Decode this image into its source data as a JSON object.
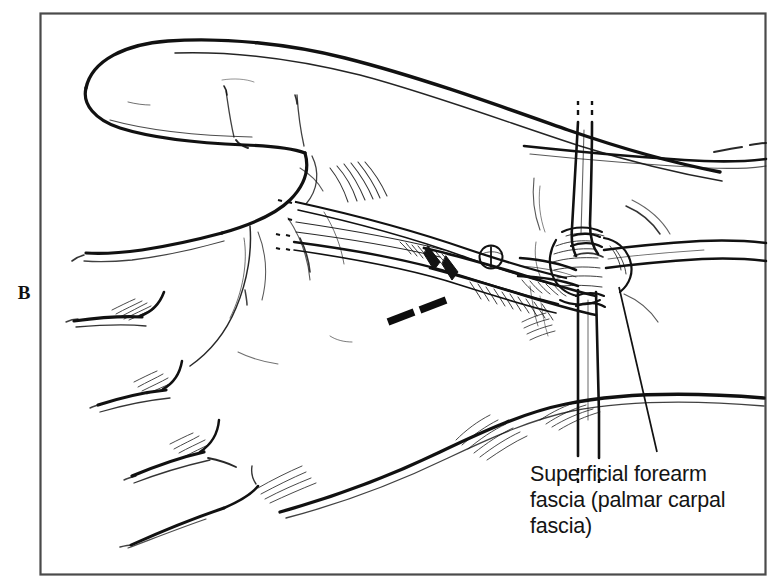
{
  "figure": {
    "panel_letter": "B",
    "background_color": "#ffffff",
    "ink_color": "#111111",
    "frame": {
      "color": "#4a4a4a",
      "x": 40,
      "y": 13,
      "width": 726,
      "height": 562
    }
  },
  "annotations": [
    {
      "id": "superficial-forearm-fascia",
      "lines": [
        "Superficial forearm",
        "fascia (palmar carpal",
        "fascia)"
      ],
      "text_x": 530,
      "text_y": 481,
      "line_height": 26,
      "leader_from": {
        "x": 657,
        "y": 452
      },
      "leader_to": {
        "x": 619,
        "y": 287
      }
    }
  ],
  "illustration": {
    "subject": "volar wrist dissection, clenched fist, thumb uppermost",
    "elements": [
      {
        "name": "thumb",
        "label": "thumb"
      },
      {
        "name": "index-finger",
        "label": "index finger"
      },
      {
        "name": "middle-finger",
        "label": "middle finger"
      },
      {
        "name": "ring-finger",
        "label": "ring finger"
      },
      {
        "name": "little-finger",
        "label": "little finger"
      },
      {
        "name": "thenar-eminence",
        "label": "thenar eminence"
      },
      {
        "name": "wrist-forearm",
        "label": "wrist and distal forearm"
      },
      {
        "name": "surgical-scissors",
        "label": "surgical dissecting scissors"
      },
      {
        "name": "retractor-band-vertical",
        "label": "vertical retracted fascial band"
      },
      {
        "name": "retractor-band-horizontal",
        "label": "horizontal retracted fascial band"
      },
      {
        "name": "incision-dashes",
        "label": "proposed incision dashes"
      }
    ]
  }
}
